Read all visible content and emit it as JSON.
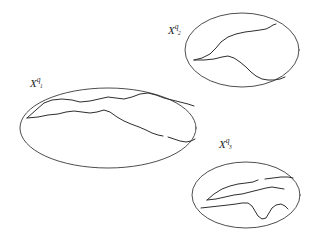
{
  "figure": {
    "type": "diagram",
    "background_color": "#ffffff",
    "stroke_color": "#2e2e2e",
    "width": 313,
    "height": 249
  },
  "regions": [
    {
      "id": "region-1",
      "label_base": "X",
      "label_sup": "q",
      "label_sub": "1",
      "label_text": "X q 1",
      "ellipse": {
        "cx": 108,
        "cy": 128,
        "rx": 88,
        "ry": 40,
        "rotation": 0
      },
      "curves": [
        "M27,118 L36,110 L44,103 L52,100 L62,99 L72,100 L80,102 L90,101 L99,99 L108,97 L116,98 L124,99 L132,97 L140,94 L148,93 L156,95 L164,98 L172,100 L180,102 L188,104 L194,106",
        "M27,118 L38,117 L48,115 L58,114 L66,112 L74,111 L82,112 L90,113 L97,112 L104,110 L110,112 L117,117 L124,121 L131,124 L139,127 L146,130 L152,133 L158,135 L163,136",
        "M168,137 L174,139 L180,141 L186,142 L191,141 L195,139"
      ]
    },
    {
      "id": "region-2",
      "label_base": "X",
      "label_sup": "q",
      "label_sub": "2",
      "label_text": "X q 2",
      "ellipse": {
        "cx": 242,
        "cy": 50,
        "rx": 57,
        "ry": 37,
        "rotation": 0
      },
      "curves": [
        "M194,60 L202,58 L210,54 L216,48 L221,42 L228,37 L236,34 L245,32 L253,31 L260,30 L266,29 L270,27 L273,25 L276,24",
        "M194,60 L204,60 L214,59 L222,57 L228,56 L234,58 L240,62 L246,67 L251,72 L256,76 L262,79 L268,80 L274,80 L280,79 L285,77"
      ]
    },
    {
      "id": "region-3",
      "label_base": "X",
      "label_sup": "q",
      "label_sub": "3",
      "label_text": "X q 3",
      "ellipse": {
        "cx": 246,
        "cy": 195,
        "rx": 54,
        "ry": 33,
        "rotation": 0
      },
      "curves": [
        "M207,200 L214,194 L222,189 L230,186 L238,184 L246,183 L253,182 L258,180",
        "M265,179 L273,178 L281,177 L288,177 L293,178",
        "M207,200 L216,199 L225,197 L234,195 L242,194 L250,192 L258,190 L266,188 L272,187 L278,188 L284,189",
        "M201,208 L210,207 L219,206 L228,205 L236,204 L242,203 L248,203 L252,206 L255,211 L258,216 L262,219 L266,218 L269,213 L272,208 L276,205 L281,204 L285,206 L288,209"
      ]
    }
  ]
}
